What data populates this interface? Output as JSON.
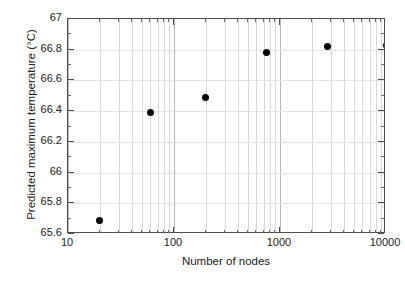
{
  "chart_data": {
    "type": "scatter",
    "title": "",
    "xlabel": "Number of nodes",
    "ylabel": "Predicted maximum temperature (°C)",
    "xscale": "log",
    "yscale": "linear",
    "xlim": [
      10,
      10000
    ],
    "ylim": [
      65.6,
      67
    ],
    "grid": true,
    "legend": "none",
    "marker": "filled-circle",
    "marker_color": "#000000",
    "x_tick_labels": [
      "10",
      "100",
      "1000",
      "10000"
    ],
    "x_tick_values": [
      10,
      100,
      1000,
      10000
    ],
    "y_tick_labels": [
      "65.6",
      "65.8",
      "66",
      "66.2",
      "66.4",
      "66.6",
      "66.8",
      "67"
    ],
    "y_tick_values": [
      65.6,
      65.8,
      66,
      66.2,
      66.4,
      66.6,
      66.8,
      67
    ],
    "series": [
      {
        "name": "Predicted maximum temperature",
        "points": [
          {
            "x": 20,
            "y": 65.69
          },
          {
            "x": 60,
            "y": 66.39
          },
          {
            "x": 200,
            "y": 66.49
          },
          {
            "x": 750,
            "y": 66.78
          },
          {
            "x": 2800,
            "y": 66.82
          },
          {
            "x": 10000,
            "y": 66.83
          }
        ]
      }
    ]
  }
}
